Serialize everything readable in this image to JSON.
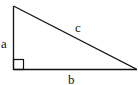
{
  "diagram": {
    "type": "right-triangle",
    "labels": {
      "vertical_leg": "a",
      "horizontal_leg": "b",
      "hypotenuse": "c"
    },
    "right_angle_marker": true,
    "stroke_color": "#111111",
    "background": "#ffffff"
  }
}
